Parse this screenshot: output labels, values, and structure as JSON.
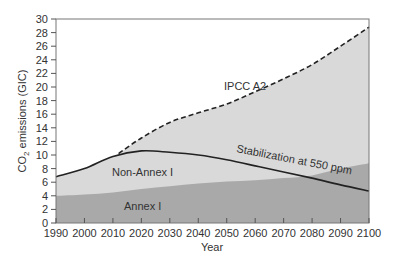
{
  "chart_data": {
    "type": "area",
    "title": "",
    "xlabel": "Year",
    "ylabel": "CO2 emissions (GIC)",
    "ylabel_parts": {
      "pre": "CO",
      "sub": "2",
      "post": " emissions (GIC)"
    },
    "xlim": [
      1990,
      2100
    ],
    "ylim": [
      0,
      30
    ],
    "grid": false,
    "legend": "none (inline labels)",
    "x_ticks": [
      1990,
      2000,
      2010,
      2020,
      2030,
      2040,
      2050,
      2060,
      2070,
      2080,
      2090,
      2100
    ],
    "y_ticks": [
      0,
      2,
      4,
      6,
      8,
      10,
      12,
      14,
      16,
      18,
      20,
      22,
      24,
      26,
      28,
      30
    ],
    "series": [
      {
        "name": "Annex I",
        "style": "filled area (dark grey)",
        "color": "#a9a9a9",
        "x": [
          1990,
          2000,
          2010,
          2020,
          2030,
          2040,
          2050,
          2060,
          2070,
          2080,
          2090,
          2100
        ],
        "values": [
          4.0,
          4.2,
          4.5,
          5.0,
          5.4,
          5.8,
          6.1,
          6.3,
          6.6,
          7.0,
          8.0,
          8.8
        ]
      },
      {
        "name": "Stabilization at 550 ppm",
        "style": "solid line; Non-Annex I light grey fill beneath",
        "color": "#222222",
        "x": [
          1990,
          2000,
          2010,
          2020,
          2030,
          2040,
          2050,
          2060,
          2070,
          2080,
          2090,
          2100
        ],
        "values": [
          6.8,
          8.0,
          9.8,
          10.6,
          10.4,
          10.0,
          9.3,
          8.4,
          7.5,
          6.6,
          5.6,
          4.7
        ]
      },
      {
        "name": "IPCC A2",
        "style": "dashed line; light grey fill beneath",
        "color": "#222222",
        "x": [
          2012,
          2020,
          2030,
          2040,
          2050,
          2060,
          2070,
          2080,
          2090,
          2100
        ],
        "values": [
          10.2,
          12.5,
          14.8,
          16.2,
          17.5,
          19.3,
          21.2,
          23.3,
          26.0,
          28.8
        ]
      }
    ],
    "annotations": [
      {
        "text": "IPCC A2",
        "x": 2045,
        "y": 20.5
      },
      {
        "text": "Stabilization at 550 ppm",
        "x": 2068,
        "y": 8.5,
        "rotation": 11
      },
      {
        "text": "Non-Annex I",
        "x": 2025,
        "y": 7.5
      },
      {
        "text": "Annex I",
        "x": 2038,
        "y": 2.3
      }
    ]
  },
  "labels": {
    "ipcc": "IPCC A2",
    "stab": "Stabilization at 550 ppm",
    "nonannex": "Non-Annex I",
    "annex": "Annex I",
    "xlabel": "Year"
  },
  "colors": {
    "light_fill": "#d9d9d9",
    "dark_fill": "#a9a9a9",
    "line": "#222222",
    "axis": "#555555"
  }
}
